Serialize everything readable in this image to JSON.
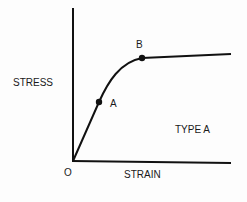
{
  "diagram": {
    "y_axis_label": "STRESS",
    "x_axis_label": "STRAIN",
    "origin_label": "O",
    "curve_type_label": "TYPE A",
    "points": [
      {
        "label": "A",
        "description": "end of linear region"
      },
      {
        "label": "B",
        "description": "start of plateau"
      }
    ]
  }
}
